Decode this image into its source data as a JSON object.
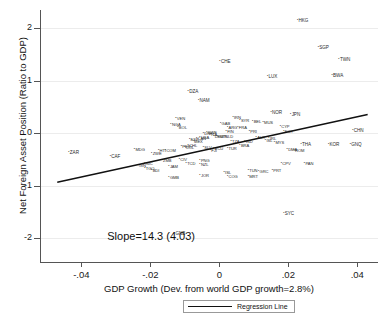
{
  "chart_data": {
    "type": "scatter",
    "title": "",
    "xlabel": "GDP Growth (Dev. from world GDP growth=2.8%)",
    "ylabel": "Net Foreign Asset Position (Ratio to GDP)",
    "xlim": [
      -0.052,
      0.046
    ],
    "ylim": [
      -2.45,
      2.35
    ],
    "xticks": [
      -0.04,
      -0.02,
      0,
      0.02,
      0.04
    ],
    "xticklabels": [
      "-.04",
      "-.02",
      "0",
      ".02",
      ".04"
    ],
    "yticks": [
      -2,
      -1,
      0,
      1,
      2
    ],
    "yticklabels": [
      "-2",
      "-1",
      "0",
      "1",
      "2"
    ],
    "grid": "horizontal",
    "annotation": "Slope=14.3 (4.03)",
    "slope": 14.3,
    "slope_se": 4.03,
    "legend": {
      "position": "below-axis",
      "entries": [
        "Regression Line"
      ]
    },
    "regression_line": {
      "x0": -0.047,
      "y0": -0.93,
      "x1": 0.043,
      "y1": 0.36
    },
    "point_label_field": "iso3",
    "points": [
      {
        "iso3": "HKG",
        "x": 0.0225,
        "y": 2.15
      },
      {
        "iso3": "SGP",
        "x": 0.0285,
        "y": 1.63
      },
      {
        "iso3": "TWN",
        "x": 0.0345,
        "y": 1.4
      },
      {
        "iso3": "CHE",
        "x": 0.0,
        "y": 1.36
      },
      {
        "iso3": "BWA",
        "x": 0.0325,
        "y": 1.1
      },
      {
        "iso3": "LUX",
        "x": 0.0138,
        "y": 1.08
      },
      {
        "iso3": "DZA",
        "x": -0.0092,
        "y": 0.8
      },
      {
        "iso3": "NAM",
        "x": -0.0062,
        "y": 0.62
      },
      {
        "iso3": "NOR",
        "x": 0.0148,
        "y": 0.4
      },
      {
        "iso3": "JPN",
        "x": 0.0205,
        "y": 0.36
      },
      {
        "iso3": "VEN",
        "x": -0.0128,
        "y": 0.28
      },
      {
        "iso3": "IRN",
        "x": 0.0038,
        "y": 0.3
      },
      {
        "iso3": "SYR",
        "x": 0.0058,
        "y": 0.24
      },
      {
        "iso3": "GAB",
        "x": 0.0002,
        "y": 0.18
      },
      {
        "iso3": "BEL",
        "x": 0.0095,
        "y": 0.22
      },
      {
        "iso3": "MUS",
        "x": 0.0125,
        "y": 0.2
      },
      {
        "iso3": "NGA",
        "x": -0.0142,
        "y": 0.16
      },
      {
        "iso3": "BOL",
        "x": -0.0122,
        "y": 0.12
      },
      {
        "iso3": "ARG",
        "x": 0.0022,
        "y": 0.12
      },
      {
        "iso3": "FRA",
        "x": 0.0052,
        "y": 0.12
      },
      {
        "iso3": "CYP",
        "x": 0.0175,
        "y": 0.14
      },
      {
        "iso3": "CHN",
        "x": 0.0385,
        "y": 0.06
      },
      {
        "iso3": "EGY",
        "x": 0.0185,
        "y": 0.04
      },
      {
        "iso3": "FIN",
        "x": 0.0018,
        "y": 0.03
      },
      {
        "iso3": "PRI",
        "x": 0.0085,
        "y": 0.03
      },
      {
        "iso3": "SWE",
        "x": -0.0038,
        "y": 0.02
      },
      {
        "iso3": "DNK",
        "x": -0.0048,
        "y": -0.01
      },
      {
        "iso3": "ITA",
        "x": -0.0028,
        "y": -0.02
      },
      {
        "iso3": "AUT",
        "x": 0.0105,
        "y": -0.08
      },
      {
        "iso3": "DEU",
        "x": -0.0018,
        "y": -0.05
      },
      {
        "iso3": "USA",
        "x": -0.0058,
        "y": -0.08
      },
      {
        "iso3": "GBR",
        "x": -0.0008,
        "y": -0.05
      },
      {
        "iso3": "NLD",
        "x": 0.0012,
        "y": -0.06
      },
      {
        "iso3": "CAN",
        "x": -0.0068,
        "y": -0.1
      },
      {
        "iso3": "ESP",
        "x": -0.0088,
        "y": -0.12
      },
      {
        "iso3": "IRL",
        "x": 0.0142,
        "y": -0.1
      },
      {
        "iso3": "ISL",
        "x": 0.0132,
        "y": -0.14
      },
      {
        "iso3": "MEX",
        "x": -0.0078,
        "y": -0.16
      },
      {
        "iso3": "TZA",
        "x": 0.0032,
        "y": -0.16
      },
      {
        "iso3": "MYS",
        "x": 0.0158,
        "y": -0.18
      },
      {
        "iso3": "IND",
        "x": 0.0072,
        "y": -0.16
      },
      {
        "iso3": "THA",
        "x": 0.0235,
        "y": -0.22
      },
      {
        "iso3": "KOR",
        "x": 0.0315,
        "y": -0.22
      },
      {
        "iso3": "GNQ",
        "x": 0.0378,
        "y": -0.22
      },
      {
        "iso3": "SLV",
        "x": -0.0048,
        "y": -0.26
      },
      {
        "iso3": "ECU",
        "x": -0.0018,
        "y": -0.28
      },
      {
        "iso3": "TUR",
        "x": 0.0022,
        "y": -0.28
      },
      {
        "iso3": "BRA",
        "x": 0.0058,
        "y": -0.24
      },
      {
        "iso3": "FJI",
        "x": -0.0028,
        "y": -0.32
      },
      {
        "iso3": "DMA",
        "x": 0.0195,
        "y": -0.3
      },
      {
        "iso3": "ROM",
        "x": 0.0215,
        "y": -0.33
      },
      {
        "iso3": "PER",
        "x": -0.0112,
        "y": -0.25
      },
      {
        "iso3": "CHL",
        "x": -0.0092,
        "y": -0.24
      },
      {
        "iso3": "COL",
        "x": -0.0102,
        "y": -0.27
      },
      {
        "iso3": "MDG",
        "x": -0.0248,
        "y": -0.3
      },
      {
        "iso3": "HTI",
        "x": -0.0178,
        "y": -0.33
      },
      {
        "iso3": "ZWE",
        "x": -0.0198,
        "y": -0.38
      },
      {
        "iso3": "COM",
        "x": -0.0158,
        "y": -0.33
      },
      {
        "iso3": "ZAR",
        "x": -0.0438,
        "y": -0.36
      },
      {
        "iso3": "CAF",
        "x": -0.0318,
        "y": -0.44
      },
      {
        "iso3": "CIV",
        "x": -0.0118,
        "y": -0.5
      },
      {
        "iso3": "ZMB",
        "x": -0.0168,
        "y": -0.52
      },
      {
        "iso3": "CPV",
        "x": 0.0178,
        "y": -0.58
      },
      {
        "iso3": "PAN",
        "x": 0.0245,
        "y": -0.58
      },
      {
        "iso3": "NIC",
        "x": -0.0218,
        "y": -0.58
      },
      {
        "iso3": "PNG",
        "x": -0.0058,
        "y": -0.52
      },
      {
        "iso3": "TCD",
        "x": -0.0098,
        "y": -0.58
      },
      {
        "iso3": "NZL",
        "x": -0.0058,
        "y": -0.6
      },
      {
        "iso3": "GIN",
        "x": -0.0238,
        "y": -0.62
      },
      {
        "iso3": "TGO",
        "x": -0.0218,
        "y": -0.66
      },
      {
        "iso3": "JAM",
        "x": -0.0148,
        "y": -0.64
      },
      {
        "iso3": "BDI",
        "x": -0.0198,
        "y": -0.7
      },
      {
        "iso3": "TUN",
        "x": 0.0082,
        "y": -0.7
      },
      {
        "iso3": "PRT",
        "x": 0.0152,
        "y": -0.7
      },
      {
        "iso3": "GRC",
        "x": 0.0112,
        "y": -0.72
      },
      {
        "iso3": "ISL",
        "x": 0.0012,
        "y": -0.74
      },
      {
        "iso3": "JOR",
        "x": -0.0058,
        "y": -0.8
      },
      {
        "iso3": "COG",
        "x": 0.0022,
        "y": -0.82
      },
      {
        "iso3": "MRT",
        "x": 0.0082,
        "y": -0.82
      },
      {
        "iso3": "GMB",
        "x": -0.0148,
        "y": -0.84
      },
      {
        "iso3": "SYC",
        "x": 0.0185,
        "y": -1.52
      },
      {
        "iso3": "GNB",
        "x": -0.0132,
        "y": -1.9
      }
    ]
  }
}
